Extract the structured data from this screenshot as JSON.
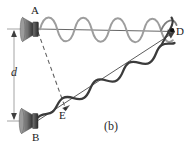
{
  "figure": {
    "caption": "(b)",
    "labels": {
      "speaker_top": "A",
      "speaker_bottom": "B",
      "receiver": "D",
      "intermediate_point": "E",
      "separation": "d"
    },
    "elements": {
      "speaker_top_name": "loudspeaker-icon",
      "speaker_bottom_name": "loudspeaker-icon",
      "top_ray_name": "ray-A-to-D",
      "bottom_ray_name": "ray-B-to-D",
      "dashed_name": "dashed-line-A-to-E",
      "dimension_name": "dimension-line-d",
      "top_wave_name": "sound-wave-upper",
      "bottom_wave_name": "sound-wave-lower",
      "point_dot_name": "point-marker-D"
    },
    "geometry": {
      "point_A": [
        36,
        29
      ],
      "point_B": [
        36,
        121
      ],
      "point_D": [
        172,
        32
      ],
      "point_E": [
        65,
        109
      ],
      "separation_axis_x": 14,
      "upper_wave_cycles": 4,
      "lower_wave_cycles": 4,
      "upper_wave_amplitude": 8,
      "lower_wave_amplitude": 10
    },
    "colors": {
      "upper_wave": "#9a9a9a",
      "lower_wave": "#3a3a3a",
      "ray": "#4a4a4a",
      "dashed": "#6a6a6a",
      "dimension": "#8a8a8a",
      "speaker_body": "#8c8c8c",
      "speaker_shadow": "#4a4a4a",
      "label_text": "#1a1a1a",
      "background": "#ffffff"
    }
  }
}
